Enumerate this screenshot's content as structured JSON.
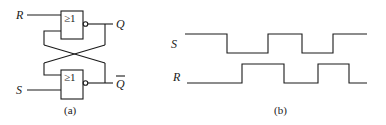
{
  "figure_a": {
    "caption": "(a)",
    "gates": [
      {
        "id": "top",
        "symbol": "≥1",
        "type": "NOR"
      },
      {
        "id": "bottom",
        "symbol": "≥1",
        "type": "NOR"
      }
    ],
    "inputs": {
      "top": "R",
      "bottom": "S"
    },
    "outputs": {
      "top": "Q",
      "bottom": "Q"
    },
    "bottom_output_overbar": true
  },
  "figure_b": {
    "caption": "(b)",
    "signals": [
      {
        "name": "S",
        "start_level": "high",
        "transitions_x": [
          227,
          268,
          302,
          333
        ]
      },
      {
        "name": "R",
        "start_level": "low",
        "transitions_x": [
          242,
          284,
          318,
          349
        ]
      }
    ]
  },
  "colors": {
    "line": "#1a1a1a",
    "background": "#ffffff"
  }
}
